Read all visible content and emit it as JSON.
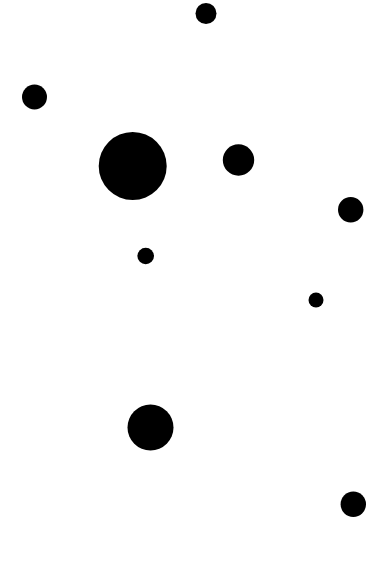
{
  "canvas": {
    "width": 384,
    "height": 563,
    "background": "#ffffff",
    "dot_color": "#000000"
  },
  "dots": [
    {
      "cx": 206,
      "cy": 13.5,
      "r": 10.5
    },
    {
      "cx": 34.5,
      "cy": 97,
      "r": 12.5
    },
    {
      "cx": 132.7,
      "cy": 166,
      "r": 34
    },
    {
      "cx": 238.5,
      "cy": 160,
      "r": 15.7
    },
    {
      "cx": 350.7,
      "cy": 209.7,
      "r": 12.7
    },
    {
      "cx": 145.7,
      "cy": 256,
      "r": 8.3
    },
    {
      "cx": 316,
      "cy": 300,
      "r": 7.5
    },
    {
      "cx": 150.5,
      "cy": 427.5,
      "r": 23
    },
    {
      "cx": 353.3,
      "cy": 504.3,
      "r": 12.7
    }
  ]
}
